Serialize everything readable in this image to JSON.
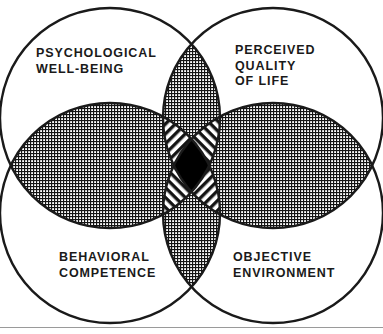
{
  "figure": {
    "type": "venn-diagram",
    "circle_count": 4,
    "stroke_color": "#1a1a1a",
    "background_color": "#ffffff",
    "center_fill_color": "#000000",
    "labels": [
      {
        "id": "psychological-well-being",
        "text": "PSYCHOLOGICAL\nWELL-BEING",
        "position": "top-left"
      },
      {
        "id": "perceived-quality-of-life",
        "text": "PERCEIVED\nQUALITY\nOF LIFE",
        "position": "top-right"
      },
      {
        "id": "behavioral-competence",
        "text": "BEHAVIORAL\nCOMPETENCE",
        "position": "bottom-left"
      },
      {
        "id": "objective-environment",
        "text": "OBJECTIVE\nENVIRONMENT",
        "position": "bottom-right"
      }
    ],
    "regions": {
      "vertical_lens_fill": "crosshatch",
      "horizontal_lens_left_fill": "crosshatch",
      "horizontal_lens_right_fill": "crosshatch",
      "triple_overlap_fill": "diagonal-stripes",
      "quadruple_overlap_fill": "solid-black"
    },
    "geometry": {
      "circles": [
        {
          "id": "psychological-well-being",
          "cx": 110,
          "cy": 165,
          "r": 157
        },
        {
          "id": "perceived-quality-of-life",
          "cx": 273,
          "cy": 165,
          "r": 157
        },
        {
          "id": "behavioral-competence",
          "cx": 110,
          "cy": 165,
          "r": 157
        },
        {
          "id": "objective-environment",
          "cx": 273,
          "cy": 165,
          "r": 157
        }
      ]
    }
  }
}
